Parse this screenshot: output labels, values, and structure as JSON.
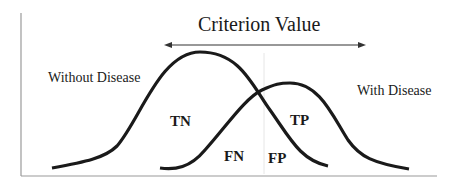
{
  "diagram": {
    "title": "Criterion Value",
    "groups": {
      "without_disease": "Without Disease",
      "with_disease": "With Disease"
    },
    "regions": {
      "tn": "TN",
      "tp": "TP",
      "fn": "FN",
      "fp": "FP"
    },
    "colors": {
      "curve": "#1a1a1a",
      "axis": "#9a9a9a",
      "threshold": "#e6e6e6",
      "arrow": "#333333",
      "text": "#1a1a1a"
    },
    "arrow_direction": "bidirectional"
  }
}
